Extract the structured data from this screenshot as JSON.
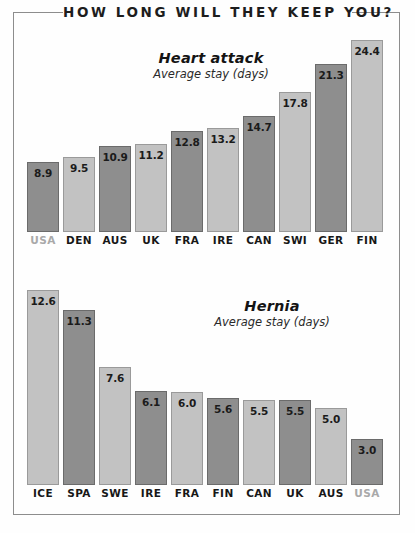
{
  "poster": {
    "title": "HOW LONG WILL THEY KEEP YOU?"
  },
  "chart_data": [
    {
      "id": "heart-attack",
      "type": "bar",
      "title": "Heart attack",
      "subtitle": "Average stay (days)",
      "xlabel": "",
      "ylabel": "Average stay (days)",
      "ylim": [
        0,
        24.4
      ],
      "grid": false,
      "legend": "none",
      "orientation": "vertical",
      "sort": "ascending",
      "categories": [
        "USA",
        "DEN",
        "AUS",
        "UK",
        "FRA",
        "IRE",
        "CAN",
        "SWI",
        "GER",
        "FIN"
      ],
      "values": [
        8.9,
        9.5,
        10.9,
        11.2,
        12.8,
        13.2,
        14.7,
        17.8,
        21.3,
        24.4
      ],
      "value_labels": [
        "8.9",
        "9.5",
        "10.9",
        "11.2",
        "12.8",
        "13.2",
        "14.7",
        "17.8",
        "21.3",
        "24.4"
      ],
      "bar_shades": [
        "dark",
        "light",
        "dark",
        "light",
        "dark",
        "light",
        "dark",
        "light",
        "dark",
        "light"
      ],
      "highlighted_category": "USA",
      "colors": {
        "dark_bar": "#8e8e8e",
        "light_bar": "#c2c2c2",
        "bar_outline": "#6f6f6f",
        "label": "#171717",
        "label_muted": "#a9a9a9"
      }
    },
    {
      "id": "hernia",
      "type": "bar",
      "title": "Hernia",
      "subtitle": "Average stay (days)",
      "xlabel": "",
      "ylabel": "Average stay (days)",
      "ylim": [
        0,
        12.6
      ],
      "grid": false,
      "legend": "none",
      "orientation": "vertical",
      "sort": "descending",
      "categories": [
        "ICE",
        "SPA",
        "SWE",
        "IRE",
        "FRA",
        "FIN",
        "CAN",
        "UK",
        "AUS",
        "USA"
      ],
      "values": [
        12.6,
        11.3,
        7.6,
        6.1,
        6.0,
        5.6,
        5.5,
        5.5,
        5.0,
        3.0
      ],
      "value_labels": [
        "12.6",
        "11.3",
        "7.6",
        "6.1",
        "6.0",
        "5.6",
        "5.5",
        "5.5",
        "5.0",
        "3.0"
      ],
      "bar_shades": [
        "light",
        "dark",
        "light",
        "dark",
        "light",
        "dark",
        "light",
        "dark",
        "light",
        "dark"
      ],
      "highlighted_category": "USA",
      "colors": {
        "dark_bar": "#8e8e8e",
        "light_bar": "#c2c2c2",
        "bar_outline": "#6f6f6f",
        "label": "#171717",
        "label_muted": "#a9a9a9"
      }
    }
  ]
}
